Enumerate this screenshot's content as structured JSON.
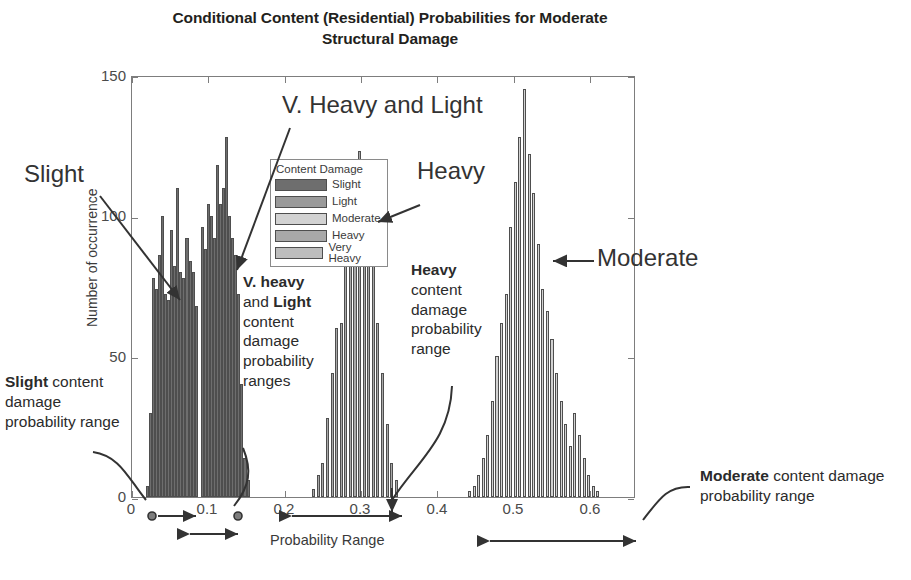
{
  "title": "Conditional Content (Residential) Probabilities for Moderate Structural Damage",
  "axes": {
    "ylabel": "Number of occurrence",
    "xlabel": "Probability Range",
    "yticks": [
      "0",
      "50",
      "100",
      "150"
    ],
    "xticks": [
      "0",
      "0.1",
      "0.2",
      "0.3",
      "0.4",
      "0.5",
      "0.6"
    ]
  },
  "legend": {
    "title": "Content Damage",
    "items": [
      {
        "label": "Slight",
        "color": "#6e6e6e"
      },
      {
        "label": "Light",
        "color": "#9a9a9a"
      },
      {
        "label": "Moderate",
        "color": "#d2d2d2"
      },
      {
        "label": "Heavy",
        "color": "#a8a8a8"
      },
      {
        "label": "Very Heavy",
        "color": "#bdbdbd"
      }
    ]
  },
  "callouts": [
    {
      "name": "slight",
      "text": "Slight"
    },
    {
      "name": "v-heavy-and-light",
      "text": "V. Heavy and Light"
    },
    {
      "name": "heavy",
      "text": "Heavy"
    },
    {
      "name": "moderate",
      "text": "Moderate"
    }
  ],
  "annotations": [
    {
      "name": "slight-range",
      "bold": "Slight",
      "rest": " content damage probability range"
    },
    {
      "name": "vheavy-light-range",
      "bold": "V. heavy",
      "bold2": "Light",
      "mid": " and ",
      "rest": " content damage probability ranges"
    },
    {
      "name": "heavy-range",
      "bold": "Heavy",
      "rest": " content damage probability range"
    },
    {
      "name": "moderate-range",
      "bold": "Moderate",
      "rest": " content damage probability range"
    }
  ],
  "chart_data": {
    "type": "bar",
    "title": "Conditional Content (Residential) Probabilities for Moderate Structural Damage",
    "xlabel": "Probability Range",
    "ylabel": "Number of occurrence",
    "xlim": [
      0.0,
      0.66
    ],
    "ylim": [
      0,
      150
    ],
    "grid": false,
    "legend_position": "top-left-inside",
    "bin_width": 0.004,
    "note": "Three histogram clusters of conditional content-damage probabilities.",
    "series": [
      {
        "name": "Slight / V. Heavy and Light cluster",
        "color": "#6e6e6e",
        "x": [
          0.018,
          0.022,
          0.026,
          0.03,
          0.034,
          0.038,
          0.042,
          0.046,
          0.05,
          0.054,
          0.058,
          0.062,
          0.066,
          0.07,
          0.074,
          0.078,
          0.082,
          0.086,
          0.09,
          0.094,
          0.098,
          0.102,
          0.106,
          0.11,
          0.114,
          0.118,
          0.122,
          0.126,
          0.13,
          0.134,
          0.138,
          0.142,
          0.146,
          0.15
        ],
        "values": [
          4,
          30,
          78,
          74,
          86,
          100,
          72,
          70,
          95,
          82,
          110,
          80,
          78,
          92,
          84,
          80,
          68,
          0,
          96,
          88,
          104,
          100,
          92,
          118,
          104,
          110,
          128,
          100,
          92,
          86,
          72,
          40,
          14,
          6
        ]
      },
      {
        "name": "Heavy cluster",
        "color": "#a8a8a8",
        "x": [
          0.236,
          0.242,
          0.248,
          0.254,
          0.26,
          0.266,
          0.272,
          0.278,
          0.284,
          0.29,
          0.296,
          0.302,
          0.308,
          0.314,
          0.32,
          0.326,
          0.332,
          0.338,
          0.344
        ],
        "values": [
          3,
          8,
          12,
          28,
          44,
          60,
          62,
          84,
          100,
          112,
          123,
          112,
          100,
          84,
          62,
          44,
          26,
          12,
          6
        ]
      },
      {
        "name": "Moderate cluster",
        "color": "#d2d2d2",
        "x": [
          0.44,
          0.446,
          0.452,
          0.458,
          0.464,
          0.47,
          0.476,
          0.482,
          0.488,
          0.494,
          0.5,
          0.506,
          0.512,
          0.518,
          0.524,
          0.53,
          0.536,
          0.542,
          0.548,
          0.554,
          0.56,
          0.566,
          0.572,
          0.578,
          0.584,
          0.59,
          0.596,
          0.602,
          0.608
        ],
        "values": [
          2,
          4,
          8,
          14,
          22,
          34,
          50,
          62,
          72,
          96,
          112,
          128,
          145,
          122,
          108,
          90,
          74,
          66,
          56,
          44,
          34,
          26,
          18,
          30,
          22,
          14,
          8,
          4,
          2
        ]
      }
    ],
    "range_markers": [
      {
        "label": "Slight content damage probability range",
        "from": 0.008,
        "to": 0.055
      },
      {
        "label": "V. heavy and Light content damage probability ranges",
        "from": 0.042,
        "to": 0.148
      },
      {
        "label": "Heavy content damage probability range",
        "from": 0.205,
        "to": 0.36
      },
      {
        "label": "Moderate content damage probability range",
        "from": 0.425,
        "to": 0.66
      }
    ]
  }
}
